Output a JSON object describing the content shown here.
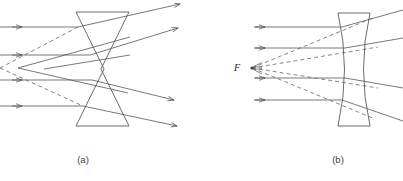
{
  "figure": {
    "background_color": "#ffffff",
    "width": 403,
    "height": 181,
    "ray_color": "#555555",
    "dashed_color": "#666666",
    "lens_color": "#5a5a5a",
    "label_color": "#3d3d3d"
  },
  "panels": [
    {
      "id": "panel-a",
      "caption": "(a)",
      "caption_x": 83,
      "caption_y": 163,
      "lens_type": "biconcave-straight-edged",
      "lens_description": "hourglass / bowtie outline drawn with straight segments",
      "lens_top_y": 12,
      "lens_bottom_y": 126,
      "lens_left_x": 76,
      "lens_right_x": 129,
      "lens_waist_x_left": 100,
      "lens_waist_x_right": 105,
      "lens_waist_y": 69,
      "incoming_ray_count": 4,
      "incoming_ray_y": [
        27,
        55,
        80,
        106
      ],
      "incoming_arrow_x": 19,
      "virtual_focus_x": 1,
      "virtual_focus_y": 68,
      "outgoing_arrow_x": [
        178,
        176,
        172,
        175
      ],
      "outgoing_arrow_y": [
        6,
        30,
        100,
        124
      ],
      "dashed_extension_count": 2
    },
    {
      "id": "panel-b",
      "caption": "(b)",
      "caption_x": 338,
      "caption_y": 163,
      "lens_type": "biconcave-curved",
      "lens_description": "biconcave lens with two concave arcs and flat top and bottom rims",
      "lens_top_y": 13,
      "lens_bottom_y": 126,
      "lens_left_x": 337,
      "lens_right_x": 371,
      "lens_waist_left_x": 352,
      "lens_waist_right_x": 357,
      "lens_waist_y": 69,
      "incoming_ray_count": 4,
      "incoming_ray_y": [
        27,
        48,
        78,
        100
      ],
      "incoming_arrow_x": 262,
      "focus_label": "F",
      "focus_label_x": 237,
      "focus_label_y": 71,
      "focus_point_x": 252,
      "focus_point_y": 68,
      "dashed_extension_count": 4
    }
  ],
  "legend_notes": {
    "solid_line_meaning": "actual light ray path",
    "dashed_line_meaning": "backward extension of refracted ray to the virtual focus",
    "arrowhead_meaning": "direction of propagation"
  }
}
